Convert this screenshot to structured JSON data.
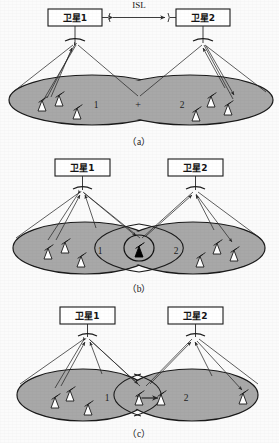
{
  "figure": {
    "background_color": "#fbfbfb",
    "ellipse_fill": "#a8a8a8",
    "ellipse_stroke": "#1a1a1a",
    "line_color": "#2a2a2a",
    "box_fill": "#ffffff",
    "box_stroke": "#1a1a1a",
    "antenna_fill": "#ffffff",
    "antenna_fill_highlight": "#000000"
  },
  "panels": [
    {
      "id": "a",
      "caption": "（a）",
      "satellite_left_label": "卫星1",
      "satellite_right_label": "卫星2",
      "isl_label": "ISL",
      "isl_present": true,
      "zone_left_label": "1",
      "zone_right_label": "2",
      "zone_join_label": "+",
      "coverage_shape": "merged-overlapping-ellipses",
      "highlight_antenna": false,
      "ground_link": false,
      "ground_stations_left": 3,
      "ground_stations_right": 3
    },
    {
      "id": "b",
      "caption": "（b）",
      "satellite_left_label": "卫星1",
      "satellite_right_label": "卫星2",
      "isl_label": "",
      "isl_present": false,
      "zone_left_label": "1",
      "zone_right_label": "2",
      "zone_join_label": "",
      "coverage_shape": "two-overlapping-ellipses",
      "highlight_antenna": true,
      "highlight_antenna_note": "circled black ground station in overlap region",
      "ground_link": false,
      "ground_stations_left": 3,
      "ground_stations_right": 3
    },
    {
      "id": "c",
      "caption": "（c）",
      "satellite_left_label": "卫星1",
      "satellite_right_label": "卫星2",
      "isl_label": "",
      "isl_present": false,
      "zone_left_label": "1",
      "zone_right_label": "2",
      "zone_join_label": "",
      "coverage_shape": "two-tangent-ellipses",
      "highlight_antenna": false,
      "ground_link": true,
      "ground_link_note": "horizontal link between two boundary ground stations",
      "ground_stations_left": 4,
      "ground_stations_right": 2
    }
  ],
  "icons": {
    "satellite_box": "satellite-box",
    "satellite_dish": "satellite-dish-arc-icon",
    "ground_station": "ground-station-antenna-icon",
    "uplink_arrow": "uplink-arrow-icon",
    "downlink_arrow": "downlink-arrow-icon",
    "isl_arrow": "bidirectional-arrow-icon"
  }
}
